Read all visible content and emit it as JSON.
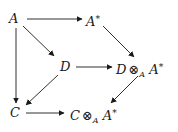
{
  "diagram": {
    "type": "commutative-diagram",
    "nodes": {
      "A": {
        "base": "A"
      },
      "A_star": {
        "base": "A",
        "sup": "*"
      },
      "D": {
        "base": "D"
      },
      "D_tensor": {
        "left": "D",
        "op": "⊗",
        "sub": "A",
        "right": "A",
        "sup": "*"
      },
      "C": {
        "base": "C"
      },
      "C_tensor": {
        "left": "C",
        "op": "⊗",
        "sub": "A",
        "right": "A",
        "sup": "*"
      }
    },
    "edges": [
      {
        "from": "A",
        "to": "A*"
      },
      {
        "from": "A",
        "to": "D"
      },
      {
        "from": "A",
        "to": "C"
      },
      {
        "from": "A*",
        "to": "D ⊗_A A*"
      },
      {
        "from": "D",
        "to": "D ⊗_A A*"
      },
      {
        "from": "D",
        "to": "C"
      },
      {
        "from": "D ⊗_A A*",
        "to": "C ⊗_A A*"
      },
      {
        "from": "C",
        "to": "C ⊗_A A*"
      }
    ]
  }
}
